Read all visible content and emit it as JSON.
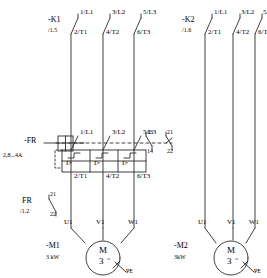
{
  "diagram": {
    "line_color": "#2b2b2b"
  },
  "contactor_k1": {
    "designation": "-K1",
    "cross_reference": "/1.5",
    "top_terminals": [
      "1/L1",
      "3/L2",
      "5/L3"
    ],
    "bottom_terminals": [
      "2/T1",
      "4/T2",
      "6/T3"
    ]
  },
  "contactor_k2": {
    "designation": "-K2",
    "cross_reference": "/1.6",
    "top_terminals": [
      "1/L1",
      "3/L2",
      "5/L3"
    ],
    "bottom_terminals": [
      "2/T1",
      "4/T2",
      "6/T3"
    ]
  },
  "overload": {
    "designation": "-FR",
    "current_range": "2,8...4A",
    "top_terminals": [
      "1/L1",
      "3/L2",
      "5/L3"
    ],
    "bottom_terminals": [
      "2/T1",
      "4/T2",
      "6/T3"
    ],
    "release_symbol": "I>",
    "aux_contact_no": {
      "top": "13",
      "bottom": "14"
    },
    "aux_contact_nc": {
      "top": "21",
      "bottom": "22"
    }
  },
  "overload_aux": {
    "designation": "FR",
    "cross_reference": "/1.2",
    "contact_top": "21",
    "contact_bottom": "22"
  },
  "motor_m1": {
    "designation": "-M1",
    "power": "3 kW",
    "terminals": [
      "U1",
      "V1",
      "W1"
    ],
    "symbol_top": "M",
    "symbol_bottom": "3",
    "phase_mark": "~",
    "earth": "PE"
  },
  "motor_m2": {
    "designation": "-M2",
    "power": "3kW",
    "terminals": [
      "U1",
      "V1",
      "W1"
    ],
    "symbol_top": "M",
    "symbol_bottom": "3",
    "phase_mark": "~",
    "earth": "PE"
  }
}
